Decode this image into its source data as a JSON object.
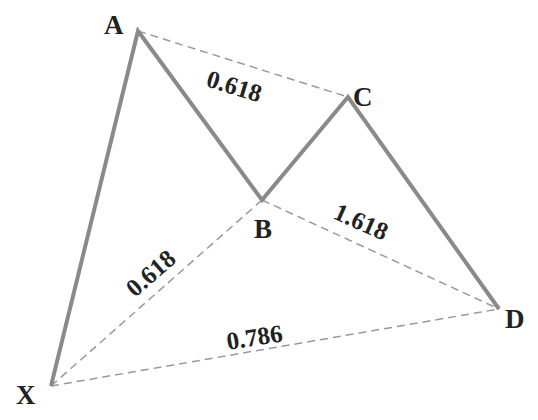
{
  "diagram": {
    "type": "harmonic-pattern",
    "colors": {
      "background": "#ffffff",
      "solid_leg": "#8a8a8a",
      "dashed_ratio": "#9a9a9a",
      "text": "#222222"
    },
    "points": {
      "X": {
        "label": "X",
        "x": 51,
        "y": 386
      },
      "A": {
        "label": "A",
        "x": 138,
        "y": 31
      },
      "B": {
        "label": "B",
        "x": 262,
        "y": 200
      },
      "C": {
        "label": "C",
        "x": 348,
        "y": 97
      },
      "D": {
        "label": "D",
        "x": 499,
        "y": 309
      }
    },
    "legs": [
      "XA",
      "AB",
      "BC",
      "CD"
    ],
    "ratios": [
      {
        "id": "AC",
        "from": "A",
        "to": "C",
        "label": "0.618"
      },
      {
        "id": "XB",
        "from": "X",
        "to": "B",
        "label": "0.618"
      },
      {
        "id": "BD",
        "from": "B",
        "to": "D",
        "label": "1.618"
      },
      {
        "id": "XD",
        "from": "X",
        "to": "D",
        "label": "0.786"
      }
    ]
  }
}
